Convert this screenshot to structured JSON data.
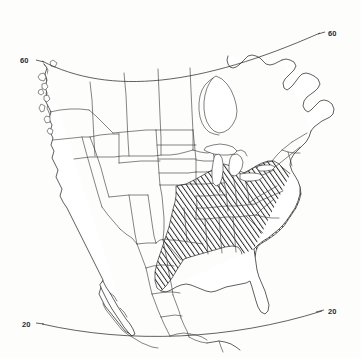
{
  "figure": {
    "kind": "thematic-outline-map",
    "region": "North America",
    "projection_style": "conic, curved parallels",
    "background_color": "#fdfdfc",
    "line_color": "#2b2b2b",
    "hatch_color": "#2b2b2b"
  },
  "graticule": {
    "labels": [
      {
        "id": "lat-60-left",
        "text": "60",
        "x": 26,
        "y": 60,
        "anchor": "start"
      },
      {
        "id": "lat-60-right",
        "text": "60",
        "x": 324,
        "y": 36,
        "anchor": "start"
      },
      {
        "id": "lat-20-left",
        "text": "20",
        "x": 28,
        "y": 325,
        "anchor": "start"
      },
      {
        "id": "lat-20-right",
        "text": "20",
        "x": 324,
        "y": 313,
        "anchor": "start"
      }
    ],
    "parallels": [
      {
        "value": "60",
        "description": "upper parallel, arcs upward to the right"
      },
      {
        "value": "20",
        "description": "lower parallel, sags slightly at center"
      }
    ]
  },
  "legend": {
    "hatched_meaning": "shaded (hatched) distribution area",
    "unhatched_meaning": "outside distribution area"
  },
  "shaded_area": {
    "pattern": "diagonal hatch",
    "direction": "lower-left to upper-right",
    "spacing_px": 3,
    "coverage_label": "eastern and southeastern United States",
    "included_notes": [
      "Great Plains eastern margin to Atlantic seaboard",
      "Gulf Coast states",
      "Ohio and Mississippi valleys",
      "lower Great Lakes states",
      "mid-Atlantic states"
    ],
    "excluded_notes": [
      "Florida peninsula",
      "New England",
      "western United States",
      "Canada",
      "Mexico"
    ]
  }
}
